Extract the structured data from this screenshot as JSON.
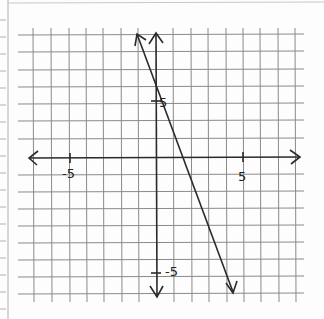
{
  "chart_data": {
    "type": "line",
    "title": "",
    "xlabel": "",
    "ylabel": "",
    "grid": true,
    "xlim": [
      -7.5,
      8
    ],
    "ylim": [
      -8,
      7.5
    ],
    "axis_ticks_labeled": {
      "x": [
        {
          "value": -5,
          "label": "-5"
        },
        {
          "value": 5,
          "label": "5"
        }
      ],
      "y": [
        {
          "value": 5,
          "label": "5"
        },
        {
          "value": -5,
          "label": "-5"
        }
      ]
    },
    "series": [
      {
        "name": "line",
        "equation": "y = -2.5x + 5",
        "x": [
          -1.1,
          4.4
        ],
        "y": [
          7.7,
          -6.0
        ],
        "arrows_both_ends": true
      }
    ]
  },
  "labels": {
    "x_neg5": "-5",
    "x_pos5": "5",
    "y_pos5": "5",
    "y_neg5": "-5"
  },
  "colors": {
    "grid": "#8a8a8a",
    "ink": "#2a2a2a",
    "paper": "#fdfdfd"
  }
}
